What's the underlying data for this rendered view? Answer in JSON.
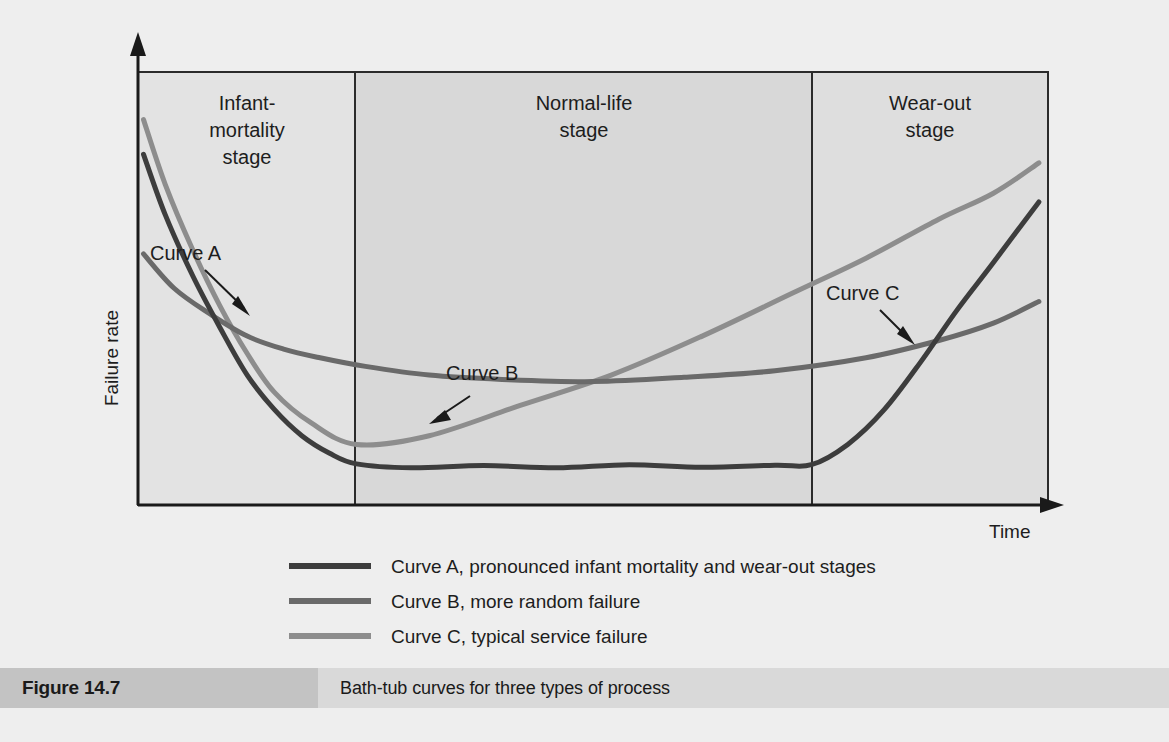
{
  "figure": {
    "number_label": "Figure 14.7",
    "caption": "Bath-tub curves for three types of process"
  },
  "axes": {
    "y_label": "Failure rate",
    "x_label": "Time"
  },
  "stages": [
    {
      "id": "infant",
      "label_line1": "Infant-",
      "label_line2": "mortality",
      "label_line3": "stage",
      "x_start_pct": 0,
      "x_end_pct": 23.9,
      "shade": "#e3e3e3"
    },
    {
      "id": "normal",
      "label_line1": "Normal-life",
      "label_line2": "stage",
      "label_line3": "",
      "x_start_pct": 23.9,
      "x_end_pct": 74.1,
      "shade": "#d8d8d8"
    },
    {
      "id": "wearout",
      "label_line1": "Wear-out",
      "label_line2": "stage",
      "label_line3": "",
      "x_start_pct": 74.1,
      "x_end_pct": 100,
      "shade": "#dedede"
    }
  ],
  "annotations": [
    {
      "id": "curve-a",
      "text": "Curve A"
    },
    {
      "id": "curve-b",
      "text": "Curve B"
    },
    {
      "id": "curve-c",
      "text": "Curve C"
    }
  ],
  "legend": {
    "items": [
      {
        "id": "curve-a",
        "text": "Curve A, pronounced infant mortality and wear-out stages",
        "color": "#3d3d3d"
      },
      {
        "id": "curve-b",
        "text": "Curve B, more random failure",
        "color": "#6a6a6a"
      },
      {
        "id": "curve-c",
        "text": "Curve C, typical service failure",
        "color": "#8d8d8d"
      }
    ]
  },
  "colors": {
    "curve_a": "#3d3d3d",
    "curve_b": "#6a6a6a",
    "curve_c": "#8d8d8d",
    "frame": "#2b2b2b",
    "page_bg": "#eeeeee",
    "caption_bar": "#d9d9d9",
    "caption_num_bg": "#c3c3c3"
  },
  "chart_data": {
    "type": "line",
    "title": "Bath-tub curves for three types of process",
    "xlabel": "Time",
    "ylabel": "Failure rate",
    "xlim": [
      0,
      100
    ],
    "ylim": [
      0,
      100
    ],
    "grid": false,
    "axis_ticks": false,
    "legend_position": "below-plot-center",
    "regions": [
      {
        "name": "Infant-mortality stage",
        "x_range": [
          0,
          23.9
        ]
      },
      {
        "name": "Normal-life stage",
        "x_range": [
          23.9,
          74.1
        ]
      },
      {
        "name": "Wear-out stage",
        "x_range": [
          74.1,
          100
        ]
      }
    ],
    "series": [
      {
        "name": "Curve A, pronounced infant mortality and wear-out stages",
        "short_name": "Curve A",
        "color": "#3d3d3d",
        "x": [
          0.6,
          3.0,
          6.0,
          9.0,
          12.0,
          15.0,
          18.0,
          21.0,
          24.0,
          30.0,
          38.0,
          46.0,
          54.0,
          62.0,
          70.0,
          74.0,
          78.0,
          82.0,
          86.0,
          90.0,
          94.0,
          99.0
        ],
        "y": [
          81.0,
          67.0,
          53.0,
          41.0,
          30.0,
          22.0,
          16.0,
          12.0,
          9.5,
          8.6,
          9.1,
          8.6,
          9.3,
          8.7,
          9.2,
          9.3,
          14.0,
          22.0,
          33.0,
          45.0,
          56.0,
          70.0
        ]
      },
      {
        "name": "Curve B, more random failure",
        "short_name": "Curve B",
        "color": "#6a6a6a",
        "x": [
          0.6,
          4.0,
          8.0,
          12.0,
          16.0,
          20.0,
          25.0,
          32.0,
          40.0,
          50.0,
          60.0,
          70.0,
          80.0,
          88.0,
          94.0,
          99.0
        ],
        "y": [
          58.0,
          50.0,
          44.0,
          39.0,
          36.0,
          34.0,
          32.0,
          30.0,
          29.0,
          28.5,
          29.5,
          31.0,
          34.0,
          38.0,
          42.0,
          47.0
        ]
      },
      {
        "name": "Curve C, typical service failure",
        "short_name": "Curve C",
        "color": "#8d8d8d",
        "x": [
          0.6,
          3.0,
          6.0,
          9.0,
          12.0,
          15.0,
          19.0,
          24.0,
          32.0,
          42.0,
          52.0,
          62.0,
          72.0,
          80.0,
          88.0,
          94.0,
          99.0
        ],
        "y": [
          89.0,
          74.0,
          59.0,
          46.0,
          35.0,
          26.0,
          19.0,
          14.0,
          16.0,
          23.0,
          30.0,
          39.0,
          49.0,
          57.0,
          66.0,
          72.0,
          79.0
        ]
      }
    ],
    "annotations": [
      {
        "text": "Curve A",
        "label_x": 18.0,
        "label_y": 72.0,
        "points_to_series": "Curve A"
      },
      {
        "text": "Curve B",
        "label_x": 38.0,
        "label_y": 45.0,
        "points_to_series": "Curve B"
      },
      {
        "text": "Curve C",
        "label_x": 77.0,
        "label_y": 58.0,
        "points_to_series": "Curve C"
      }
    ]
  }
}
